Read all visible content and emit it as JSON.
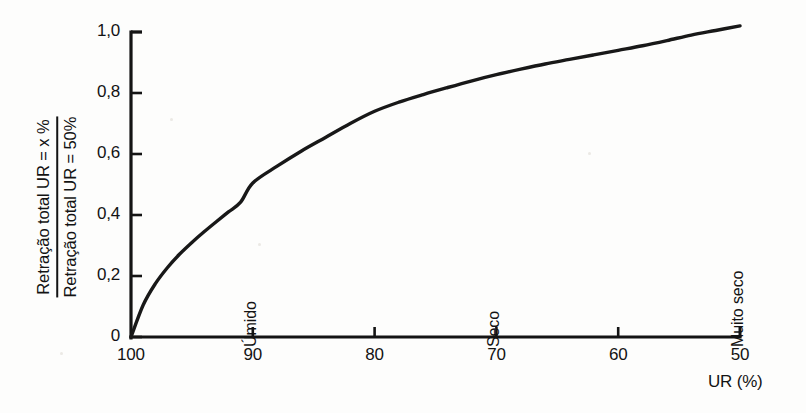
{
  "chart_data": {
    "type": "line",
    "title": "",
    "subtitle": "",
    "ylabel_numerator": "Retração total UR = x %",
    "ylabel_denominator": "Retração total UR = 50%",
    "xlabel": "UR (%)",
    "xlim": [
      100,
      50
    ],
    "ylim": [
      0,
      1.0
    ],
    "x_reversed": true,
    "grid": false,
    "legend": null,
    "xticks": [
      100,
      90,
      80,
      70,
      60,
      50
    ],
    "xtick_labels": [
      "100",
      "90",
      "80",
      "70",
      "60",
      "50"
    ],
    "yticks": [
      0,
      0.2,
      0.4,
      0.6,
      0.8,
      1.0
    ],
    "ytick_labels": [
      "0",
      "0,2",
      "0,4",
      "0,6",
      "0,8",
      "1,0"
    ],
    "series": [
      {
        "name": "Retração relativa",
        "x": [
          100,
          99,
          98,
          97,
          96,
          95,
          94,
          93,
          92,
          91,
          90,
          88,
          86,
          84,
          82,
          80,
          78,
          76,
          74,
          72,
          70,
          68,
          66,
          64,
          62,
          60,
          58,
          56,
          54,
          52,
          50
        ],
        "values": [
          0.0,
          0.105,
          0.175,
          0.228,
          0.272,
          0.31,
          0.345,
          0.378,
          0.41,
          0.442,
          0.505,
          0.56,
          0.61,
          0.655,
          0.7,
          0.74,
          0.77,
          0.795,
          0.818,
          0.84,
          0.86,
          0.878,
          0.895,
          0.91,
          0.925,
          0.94,
          0.955,
          0.972,
          0.99,
          1.005,
          1.02
        ]
      }
    ],
    "annotations": [
      {
        "text": "Úmido",
        "x": 90,
        "orientation": "vertical"
      },
      {
        "text": "Seco",
        "x": 70,
        "orientation": "vertical"
      },
      {
        "text": "Muito seco",
        "x": 50,
        "orientation": "vertical"
      }
    ],
    "colors": {
      "line": "#181818",
      "axis": "#141414",
      "background": "#fdfdfc"
    }
  }
}
